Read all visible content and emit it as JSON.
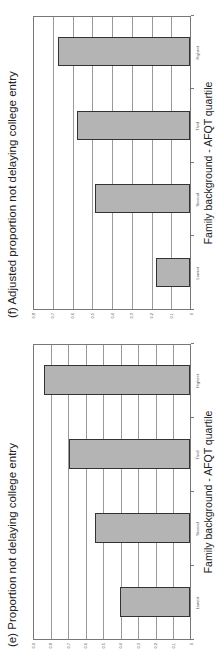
{
  "chart_data": [
    {
      "type": "bar",
      "title": "(e) Proportion not delaying college entry",
      "xlabel": "Family background - AFQT quartile",
      "ylabel": "",
      "categories": [
        "Lowest",
        "Second",
        "Third",
        "Highest"
      ],
      "values": [
        0.4,
        0.54,
        0.69,
        0.83
      ],
      "ylim": [
        0,
        0.9
      ],
      "yticks": [
        "0",
        "0.1",
        "0.2",
        "0.3",
        "0.4",
        "0.5",
        "0.6",
        "0.7",
        "0.8",
        "0.9"
      ],
      "grid": true,
      "legend": null
    },
    {
      "type": "bar",
      "title": "(f) Adjusted proportion not delaying college entry",
      "xlabel": "Family background - AFQT quartile",
      "ylabel": "",
      "categories": [
        "Lowest",
        "Second",
        "Third",
        "Highest"
      ],
      "values": [
        0.17,
        0.48,
        0.57,
        0.67
      ],
      "ylim": [
        0,
        0.8
      ],
      "yticks": [
        "0",
        "0.1",
        "0.2",
        "0.3",
        "0.4",
        "0.5",
        "0.6",
        "0.7",
        "0.8"
      ],
      "grid": true,
      "legend": null
    }
  ],
  "colors": {
    "bar_fill": "#b4b4b4",
    "bar_edge": "#333333",
    "grid": "#9a9a9a"
  },
  "page": {
    "orientation": "rotated 90° counter-clockwise"
  }
}
